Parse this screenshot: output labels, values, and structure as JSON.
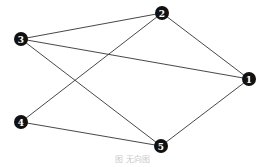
{
  "graph": {
    "type": "undirected",
    "nodes": [
      {
        "id": "1",
        "label": "1",
        "x": 249,
        "y": 79
      },
      {
        "id": "2",
        "label": "2",
        "x": 162,
        "y": 13
      },
      {
        "id": "3",
        "label": "3",
        "x": 21,
        "y": 39
      },
      {
        "id": "4",
        "label": "4",
        "x": 21,
        "y": 122
      },
      {
        "id": "5",
        "label": "5",
        "x": 161,
        "y": 146
      }
    ],
    "edges": [
      [
        "3",
        "2"
      ],
      [
        "3",
        "1"
      ],
      [
        "3",
        "5"
      ],
      [
        "2",
        "1"
      ],
      [
        "2",
        "4"
      ],
      [
        "4",
        "5"
      ],
      [
        "5",
        "1"
      ]
    ]
  },
  "caption": "图 无向图"
}
